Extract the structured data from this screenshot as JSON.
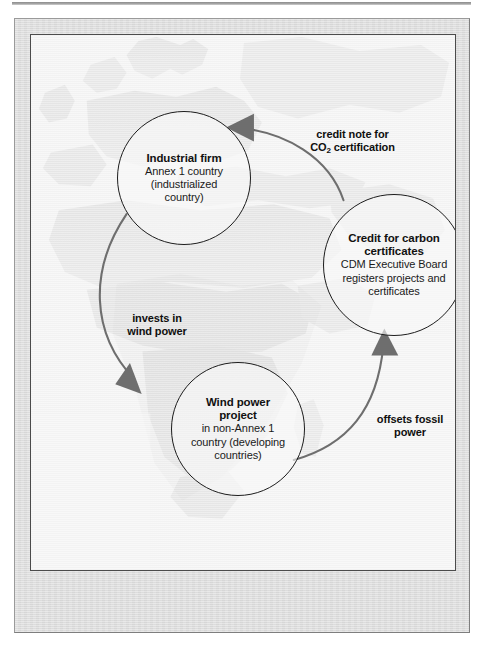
{
  "figure": {
    "background_image": "world-map-europe-africa",
    "plate_color": "#dcdcdc",
    "canvas_color": "#f4f4f4",
    "arrow_color": "#6e6e6e",
    "circle_stroke": "#1d1d1d"
  },
  "nodes": [
    {
      "id": "industrial-firm",
      "title": "Industrial firm",
      "sub_lines": [
        "Annex 1 country",
        "(industrialized",
        "country)"
      ]
    },
    {
      "id": "credit-for-carbon-certificates",
      "title_lines": [
        "Credit for carbon",
        "certificates"
      ],
      "sub_lines": [
        "CDM Executive Board",
        "registers projects and",
        "certificates"
      ]
    },
    {
      "id": "wind-power-project",
      "title_lines": [
        "Wind power",
        "project"
      ],
      "sub_lines": [
        "in non-Annex 1",
        "country (developing",
        "countries)"
      ]
    }
  ],
  "edges": [
    {
      "id": "invests-in-wind-power",
      "from": "industrial-firm",
      "to": "wind-power-project",
      "label_lines": [
        "invests in",
        "wind power"
      ]
    },
    {
      "id": "offsets-fossil-power",
      "from": "wind-power-project",
      "to": "credit-for-carbon-certificates",
      "label_lines": [
        "offsets fossil",
        "power"
      ]
    },
    {
      "id": "credit-note-for-co2-certification",
      "from": "credit-for-carbon-certificates",
      "to": "industrial-firm",
      "label_line_1": "credit note for",
      "label_line_2_pre": "CO",
      "label_line_2_sub": "2",
      "label_line_2_post": " certification"
    }
  ],
  "caption": {
    "text": ""
  }
}
